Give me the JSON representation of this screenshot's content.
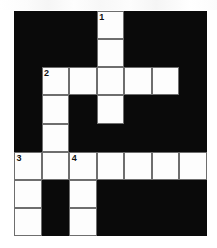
{
  "puzzle": {
    "title": "",
    "type": "crossword-grid",
    "columns": 7,
    "rows": 8,
    "cell_size_px": 27.5,
    "colors": {
      "block": "#0a0a0a",
      "open": "#fdfdfd",
      "grid_line": "#6e6e6e",
      "number_text": "#111111",
      "page_background": "#ffffff"
    },
    "numbers_visible": [
      "1",
      "2",
      "3",
      "4"
    ],
    "clue_numbers": [
      {
        "number": "1",
        "row": 0,
        "col": 3,
        "direction": "down"
      },
      {
        "number": "2",
        "row": 2,
        "col": 1,
        "direction": "across-and-down"
      },
      {
        "number": "3",
        "row": 5,
        "col": 0,
        "direction": "across-and-down"
      },
      {
        "number": "4",
        "row": 5,
        "col": 2,
        "direction": "down"
      }
    ],
    "grid": [
      [
        {
          "state": "block",
          "number": ""
        },
        {
          "state": "block",
          "number": ""
        },
        {
          "state": "block",
          "number": ""
        },
        {
          "state": "open",
          "number": "1"
        },
        {
          "state": "block",
          "number": ""
        },
        {
          "state": "block",
          "number": ""
        },
        {
          "state": "block",
          "number": ""
        }
      ],
      [
        {
          "state": "block",
          "number": ""
        },
        {
          "state": "block",
          "number": ""
        },
        {
          "state": "block",
          "number": ""
        },
        {
          "state": "open",
          "number": ""
        },
        {
          "state": "block",
          "number": ""
        },
        {
          "state": "block",
          "number": ""
        },
        {
          "state": "block",
          "number": ""
        }
      ],
      [
        {
          "state": "block",
          "number": ""
        },
        {
          "state": "open",
          "number": "2"
        },
        {
          "state": "open",
          "number": ""
        },
        {
          "state": "open",
          "number": ""
        },
        {
          "state": "open",
          "number": ""
        },
        {
          "state": "open",
          "number": ""
        },
        {
          "state": "block",
          "number": ""
        }
      ],
      [
        {
          "state": "block",
          "number": ""
        },
        {
          "state": "open",
          "number": ""
        },
        {
          "state": "block",
          "number": ""
        },
        {
          "state": "open",
          "number": ""
        },
        {
          "state": "block",
          "number": ""
        },
        {
          "state": "block",
          "number": ""
        },
        {
          "state": "block",
          "number": ""
        }
      ],
      [
        {
          "state": "block",
          "number": ""
        },
        {
          "state": "open",
          "number": ""
        },
        {
          "state": "block",
          "number": ""
        },
        {
          "state": "block",
          "number": ""
        },
        {
          "state": "block",
          "number": ""
        },
        {
          "state": "block",
          "number": ""
        },
        {
          "state": "block",
          "number": ""
        }
      ],
      [
        {
          "state": "open",
          "number": "3"
        },
        {
          "state": "open",
          "number": ""
        },
        {
          "state": "open",
          "number": "4"
        },
        {
          "state": "open",
          "number": ""
        },
        {
          "state": "open",
          "number": ""
        },
        {
          "state": "open",
          "number": ""
        },
        {
          "state": "open",
          "number": ""
        }
      ],
      [
        {
          "state": "open",
          "number": ""
        },
        {
          "state": "block",
          "number": ""
        },
        {
          "state": "open",
          "number": ""
        },
        {
          "state": "block",
          "number": ""
        },
        {
          "state": "block",
          "number": ""
        },
        {
          "state": "block",
          "number": ""
        },
        {
          "state": "block",
          "number": ""
        }
      ],
      [
        {
          "state": "open",
          "number": ""
        },
        {
          "state": "block",
          "number": ""
        },
        {
          "state": "open",
          "number": ""
        },
        {
          "state": "block",
          "number": ""
        },
        {
          "state": "block",
          "number": ""
        },
        {
          "state": "block",
          "number": ""
        },
        {
          "state": "block",
          "number": ""
        }
      ]
    ]
  }
}
